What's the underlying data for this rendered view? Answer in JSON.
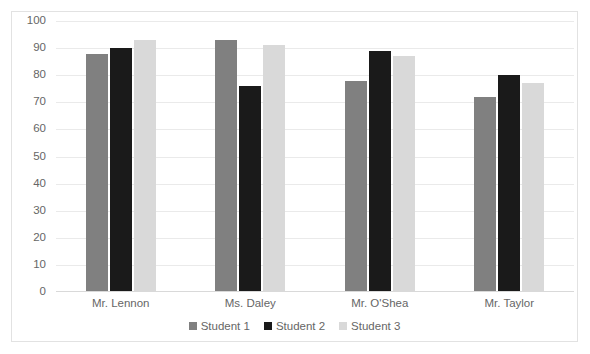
{
  "chart_data": {
    "type": "bar",
    "title": "",
    "subtitle": "",
    "xlabel": "",
    "ylabel": "",
    "ylim": [
      0,
      100
    ],
    "ytick_step": 10,
    "yticks": [
      "100",
      "90",
      "80",
      "70",
      "60",
      "50",
      "40",
      "30",
      "20",
      "10",
      "0"
    ],
    "grid": true,
    "legend_position": "bottom",
    "categories": [
      "Mr. Lennon",
      "Ms. Daley",
      "Mr. O'Shea",
      "Mr. Taylor"
    ],
    "series": [
      {
        "name": "Student 1",
        "color": "#808080",
        "values": [
          88,
          93,
          78,
          72
        ]
      },
      {
        "name": "Student 2",
        "color": "#1a1a1a",
        "values": [
          90,
          76,
          89,
          80
        ]
      },
      {
        "name": "Student 3",
        "color": "#d9d9d9",
        "values": [
          93,
          91,
          87,
          77
        ]
      }
    ]
  },
  "style": {
    "border_color": "#e2e2e2",
    "gridline_color": "#eaeaea",
    "axis_color": "#d9d9d9",
    "text_color": "#666666",
    "background": "#ffffff"
  }
}
